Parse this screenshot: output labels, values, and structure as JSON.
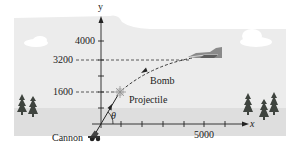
{
  "diagram": {
    "title": "",
    "axes": {
      "x_label": "x",
      "y_label": "y",
      "y_ticks_labeled": [
        "4000",
        "3200",
        "1600"
      ],
      "x_ticks_labeled": [
        "5000"
      ]
    },
    "labels": {
      "bomb": "Bomb",
      "projectile": "Projectile",
      "cannon": "Cannon",
      "angle": "θ"
    },
    "colors": {
      "sky": "#e8e8e8",
      "ground": "#dcdcdc",
      "ink": "#222222",
      "tree": "#3a3f3a"
    }
  }
}
